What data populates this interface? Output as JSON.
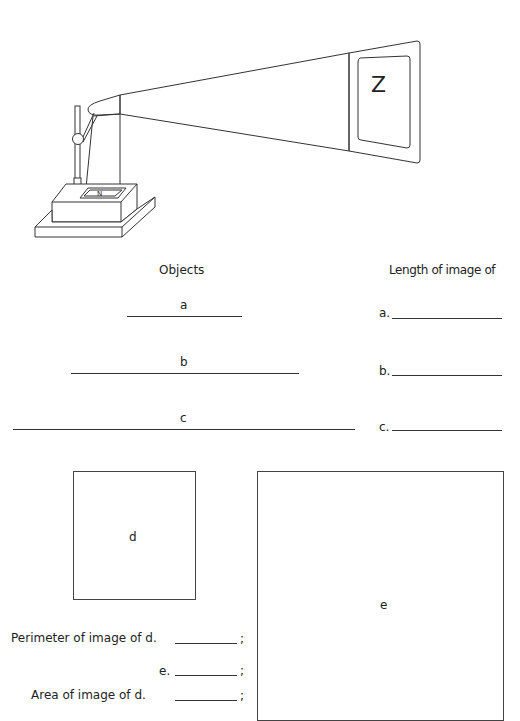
{
  "illustration": {
    "description": "overhead projector projecting image onto screen",
    "screen_letter": "Z",
    "stage_letter": "N"
  },
  "headers": {
    "objects": "Objects",
    "length_of_image": "Length of image of"
  },
  "objects": [
    {
      "label": "a",
      "answer_label": "a."
    },
    {
      "label": "b",
      "answer_label": "b."
    },
    {
      "label": "c",
      "answer_label": "c."
    }
  ],
  "squares": {
    "d": {
      "label": "d"
    },
    "e": {
      "label": "e"
    }
  },
  "questions": [
    {
      "text": "Perimeter of image of d.",
      "suffix": ";"
    },
    {
      "text": "e.",
      "suffix": ";"
    },
    {
      "text": "Area of image of d.",
      "suffix": ";"
    }
  ]
}
